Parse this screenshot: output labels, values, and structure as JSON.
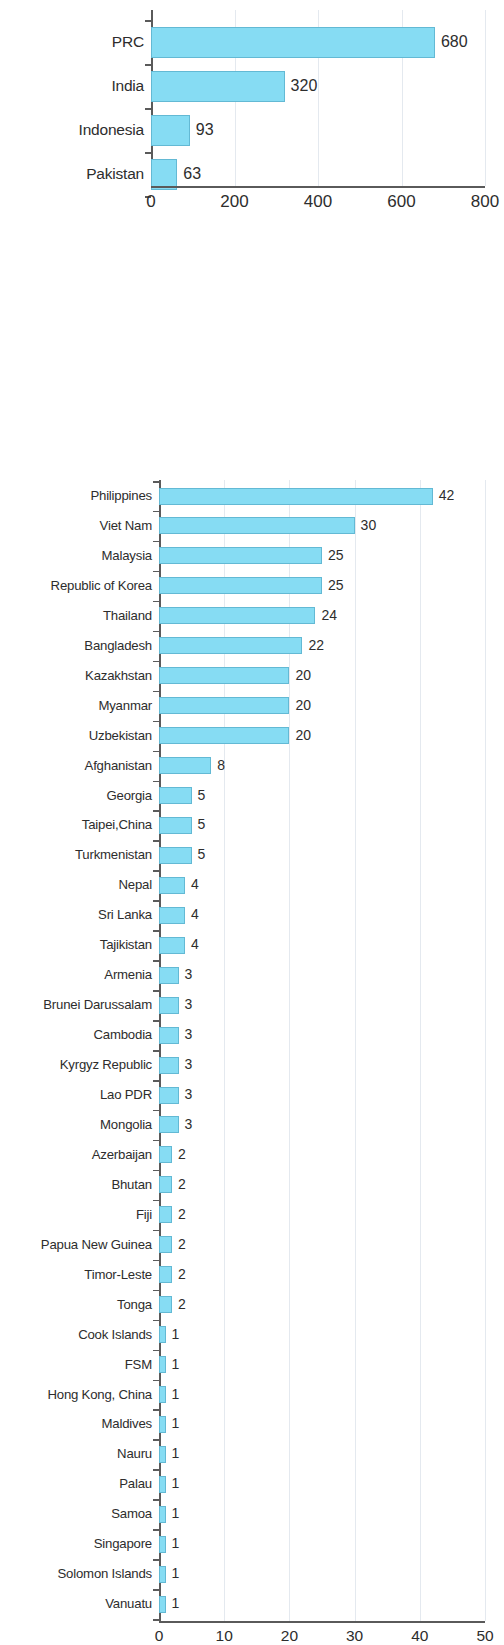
{
  "figure": {
    "background_color": "#ffffff",
    "bar_fill_color": "#86dcf3",
    "bar_border_color": "#63b9d4",
    "axis_color": "#5a5a5a",
    "gridline_color": "#e4e9ef",
    "text_color": "#2d2d2d"
  },
  "chart_data": [
    {
      "type": "bar",
      "orientation": "horizontal",
      "title": "",
      "subtitle": "",
      "xlabel": "",
      "ylabel": "",
      "xlim": [
        0,
        800
      ],
      "xticks": [
        0,
        200,
        400,
        600,
        800
      ],
      "xtick_labels": [
        "0",
        "200",
        "400",
        "600",
        "800"
      ],
      "grid": true,
      "grid_axis": "x",
      "legend": false,
      "categories": [
        "PRC",
        "India",
        "Indonesia",
        "Pakistan"
      ],
      "values": [
        680,
        320,
        93,
        63
      ],
      "data_labels": [
        "680",
        "320",
        "93",
        "63"
      ],
      "bars": [
        {
          "label": "PRC",
          "value": 680,
          "value_label": "680"
        },
        {
          "label": "India",
          "value": 320,
          "value_label": "320"
        },
        {
          "label": "Indonesia",
          "value": 93,
          "value_label": "93"
        },
        {
          "label": "Pakistan",
          "value": 63,
          "value_label": "63"
        }
      ]
    },
    {
      "type": "bar",
      "orientation": "horizontal",
      "title": "",
      "subtitle": "",
      "xlabel": "",
      "ylabel": "",
      "xlim": [
        0,
        50
      ],
      "xticks": [
        0,
        10,
        20,
        30,
        40,
        50
      ],
      "xtick_labels": [
        "0",
        "10",
        "20",
        "30",
        "40",
        "50"
      ],
      "grid": true,
      "grid_axis": "x",
      "legend": false,
      "categories": [
        "Philippines",
        "Viet Nam",
        "Malaysia",
        "Republic of Korea",
        "Thailand",
        "Bangladesh",
        "Kazakhstan",
        "Myanmar",
        "Uzbekistan",
        "Afghanistan",
        "Georgia",
        "Taipei,China",
        "Turkmenistan",
        "Nepal",
        "Sri Lanka",
        "Tajikistan",
        "Armenia",
        "Brunei Darussalam",
        "Cambodia",
        "Kyrgyz Republic",
        "Lao PDR",
        "Mongolia",
        "Azerbaijan",
        "Bhutan",
        "Fiji",
        "Papua New Guinea",
        "Timor-Leste",
        "Tonga",
        "Cook Islands",
        "FSM",
        "Hong Kong, China",
        "Maldives",
        "Nauru",
        "Palau",
        "Samoa",
        "Singapore",
        "Solomon Islands",
        "Vanuatu"
      ],
      "values": [
        42,
        30,
        25,
        25,
        24,
        22,
        20,
        20,
        20,
        8,
        5,
        5,
        5,
        4,
        4,
        4,
        3,
        3,
        3,
        3,
        3,
        3,
        2,
        2,
        2,
        2,
        2,
        2,
        1,
        1,
        1,
        1,
        1,
        1,
        1,
        1,
        1,
        1
      ],
      "data_labels": [
        "42",
        "30",
        "25",
        "25",
        "24",
        "22",
        "20",
        "20",
        "20",
        "8",
        "5",
        "5",
        "5",
        "4",
        "4",
        "4",
        "3",
        "3",
        "3",
        "3",
        "3",
        "3",
        "2",
        "2",
        "2",
        "2",
        "2",
        "2",
        "1",
        "1",
        "1",
        "1",
        "1",
        "1",
        "1",
        "1",
        "1",
        "1"
      ],
      "bars": [
        {
          "label": "Philippines",
          "value": 42,
          "value_label": "42"
        },
        {
          "label": "Viet Nam",
          "value": 30,
          "value_label": "30"
        },
        {
          "label": "Malaysia",
          "value": 25,
          "value_label": "25"
        },
        {
          "label": "Republic of Korea",
          "value": 25,
          "value_label": "25"
        },
        {
          "label": "Thailand",
          "value": 24,
          "value_label": "24"
        },
        {
          "label": "Bangladesh",
          "value": 22,
          "value_label": "22"
        },
        {
          "label": "Kazakhstan",
          "value": 20,
          "value_label": "20"
        },
        {
          "label": "Myanmar",
          "value": 20,
          "value_label": "20"
        },
        {
          "label": "Uzbekistan",
          "value": 20,
          "value_label": "20"
        },
        {
          "label": "Afghanistan",
          "value": 8,
          "value_label": "8"
        },
        {
          "label": "Georgia",
          "value": 5,
          "value_label": "5"
        },
        {
          "label": "Taipei,China",
          "value": 5,
          "value_label": "5"
        },
        {
          "label": "Turkmenistan",
          "value": 5,
          "value_label": "5"
        },
        {
          "label": "Nepal",
          "value": 4,
          "value_label": "4"
        },
        {
          "label": "Sri Lanka",
          "value": 4,
          "value_label": "4"
        },
        {
          "label": "Tajikistan",
          "value": 4,
          "value_label": "4"
        },
        {
          "label": "Armenia",
          "value": 3,
          "value_label": "3"
        },
        {
          "label": "Brunei Darussalam",
          "value": 3,
          "value_label": "3"
        },
        {
          "label": "Cambodia",
          "value": 3,
          "value_label": "3"
        },
        {
          "label": "Kyrgyz Republic",
          "value": 3,
          "value_label": "3"
        },
        {
          "label": "Lao PDR",
          "value": 3,
          "value_label": "3"
        },
        {
          "label": "Mongolia",
          "value": 3,
          "value_label": "3"
        },
        {
          "label": "Azerbaijan",
          "value": 2,
          "value_label": "2"
        },
        {
          "label": "Bhutan",
          "value": 2,
          "value_label": "2"
        },
        {
          "label": "Fiji",
          "value": 2,
          "value_label": "2"
        },
        {
          "label": "Papua New Guinea",
          "value": 2,
          "value_label": "2"
        },
        {
          "label": "Timor-Leste",
          "value": 2,
          "value_label": "2"
        },
        {
          "label": "Tonga",
          "value": 2,
          "value_label": "2"
        },
        {
          "label": "Cook Islands",
          "value": 1,
          "value_label": "1"
        },
        {
          "label": "FSM",
          "value": 1,
          "value_label": "1"
        },
        {
          "label": "Hong Kong, China",
          "value": 1,
          "value_label": "1"
        },
        {
          "label": "Maldives",
          "value": 1,
          "value_label": "1"
        },
        {
          "label": "Nauru",
          "value": 1,
          "value_label": "1"
        },
        {
          "label": "Palau",
          "value": 1,
          "value_label": "1"
        },
        {
          "label": "Samoa",
          "value": 1,
          "value_label": "1"
        },
        {
          "label": "Singapore",
          "value": 1,
          "value_label": "1"
        },
        {
          "label": "Solomon Islands",
          "value": 1,
          "value_label": "1"
        },
        {
          "label": "Vanuatu",
          "value": 1,
          "value_label": "1"
        }
      ]
    }
  ],
  "layout": [
    {
      "id": "chart-top",
      "top": 0,
      "axis_x_px": 151,
      "axis_right_px": 485,
      "plot_top_px": 10,
      "plot_bottom_px": 186,
      "row_pitch_px": 44,
      "first_row_center_px": 32,
      "bar_height_px": 31,
      "xaxis_label_y_px": 192
    },
    {
      "id": "chart-bottom",
      "top": 258,
      "axis_x_px": 159,
      "axis_right_px": 485,
      "plot_top_px": 0,
      "plot_bottom_px": 1141,
      "row_pitch_px": 29.95,
      "first_row_center_px": 16,
      "bar_height_px": 17,
      "xaxis_label_y_px": 1147
    }
  ]
}
